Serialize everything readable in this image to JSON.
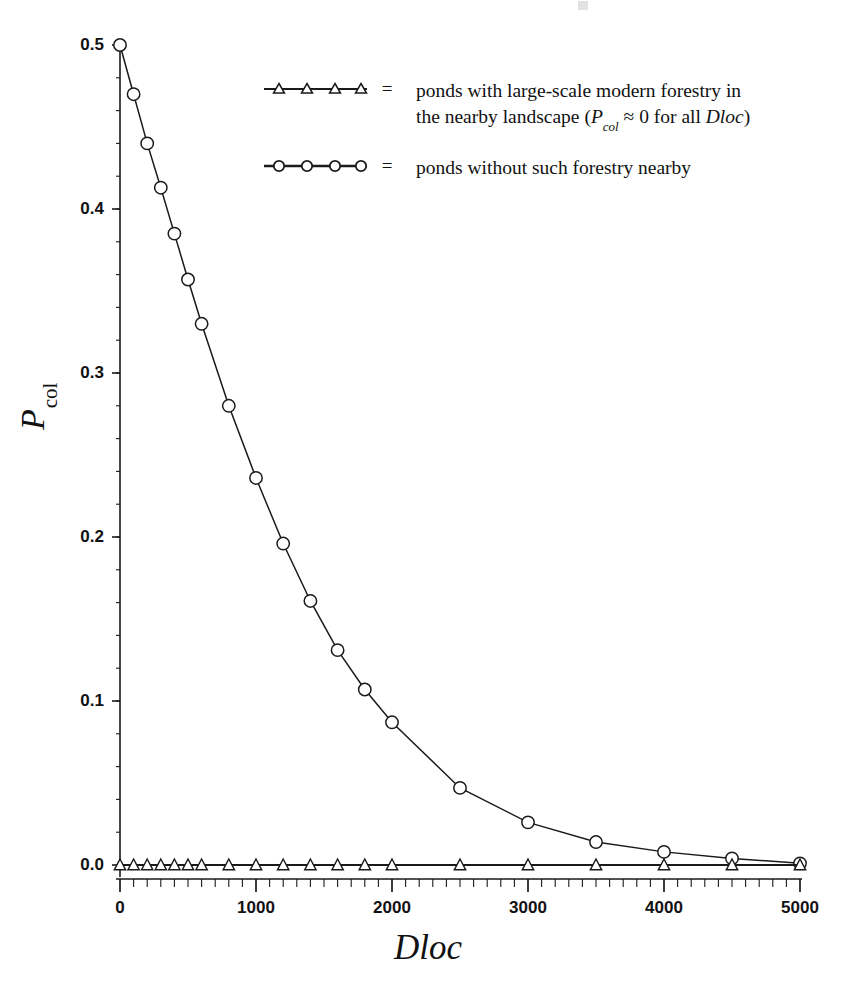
{
  "chart_data": {
    "type": "line",
    "title": "",
    "subtitle": "",
    "xlabel": "Dloc",
    "ylabel": "P",
    "ylabel_sub": "col",
    "xlim": [
      0,
      5000
    ],
    "ylim": [
      0.0,
      0.5
    ],
    "grid": false,
    "legend_position": "upper-center",
    "x_ticks": [
      0,
      1000,
      2000,
      3000,
      4000,
      5000
    ],
    "x_tick_labels": [
      "0",
      "1000",
      "2000",
      "3000",
      "4000",
      "5000"
    ],
    "x_minor_interval": 100,
    "y_ticks": [
      0.0,
      0.1,
      0.2,
      0.3,
      0.4,
      0.5
    ],
    "y_tick_labels": [
      "0.0",
      "0.1",
      "0.2",
      "0.3",
      "0.4",
      "0.5"
    ],
    "y_minor_interval": 0.02,
    "series": [
      {
        "name": "ponds without such forestry nearby",
        "marker": "circle",
        "x": [
          0,
          100,
          200,
          300,
          400,
          500,
          600,
          800,
          1000,
          1200,
          1400,
          1600,
          1800,
          2000,
          2500,
          3000,
          3500,
          4000,
          4500,
          5000
        ],
        "values": [
          0.5,
          0.47,
          0.44,
          0.413,
          0.385,
          0.357,
          0.33,
          0.28,
          0.236,
          0.196,
          0.161,
          0.131,
          0.107,
          0.087,
          0.047,
          0.026,
          0.014,
          0.008,
          0.004,
          0.001
        ]
      },
      {
        "name": "ponds with large-scale modern forestry in the nearby landscape",
        "marker": "triangle",
        "x": [
          0,
          100,
          200,
          300,
          400,
          500,
          600,
          800,
          1000,
          1200,
          1400,
          1600,
          1800,
          2000,
          2500,
          3000,
          3500,
          4000,
          4500,
          5000
        ],
        "values": [
          0.0,
          0.0,
          0.0,
          0.0,
          0.0,
          0.0,
          0.0,
          0.0,
          0.0,
          0.0,
          0.0,
          0.0,
          0.0,
          0.0,
          0.0,
          0.0,
          0.0,
          0.0,
          0.0,
          0.0
        ]
      }
    ]
  },
  "legend": {
    "equals": "=",
    "rows": [
      {
        "marker": "triangle",
        "line1": "ponds with large-scale modern forestry in",
        "line2_pre": "the nearby landscape (",
        "line2_sym": "P",
        "line2_sub": "col",
        "line2_mid": " ≈ 0 for all ",
        "line2_var": "Dloc",
        "line2_post": ")"
      },
      {
        "marker": "circle",
        "line1": "ponds without such forestry nearby",
        "line2_pre": "",
        "line2_sym": "",
        "line2_sub": "",
        "line2_mid": "",
        "line2_var": "",
        "line2_post": ""
      }
    ]
  },
  "axes": {
    "x_label": "Dloc",
    "y_label_main": "P",
    "y_label_sub": "col"
  },
  "colors": {
    "line": "#1a1a1a",
    "marker_fill": "#ffffff",
    "axis": "#1a1a1a",
    "background": "#ffffff"
  }
}
